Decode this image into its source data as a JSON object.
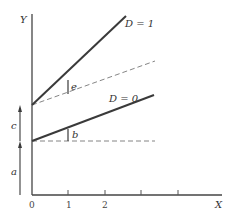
{
  "diagram": {
    "axes": {
      "y_label": "Y",
      "x_label": "X",
      "x_ticks": [
        "0",
        "1",
        "2",
        "",
        ""
      ]
    },
    "lines": [
      {
        "name": "D = 1",
        "label": "D = 1",
        "style": "solid"
      },
      {
        "name": "D = 0",
        "label": "D = 0",
        "style": "solid"
      },
      {
        "name": "D=1 baseline slope",
        "style": "dashed"
      },
      {
        "name": "D=0 intercept baseline",
        "style": "dashed"
      }
    ],
    "annotations": {
      "a": "a",
      "c": "c",
      "b": "b",
      "e": "e"
    },
    "colors": {
      "line": "#3a3a3a",
      "dashed": "#777777",
      "axis": "#444444"
    }
  }
}
